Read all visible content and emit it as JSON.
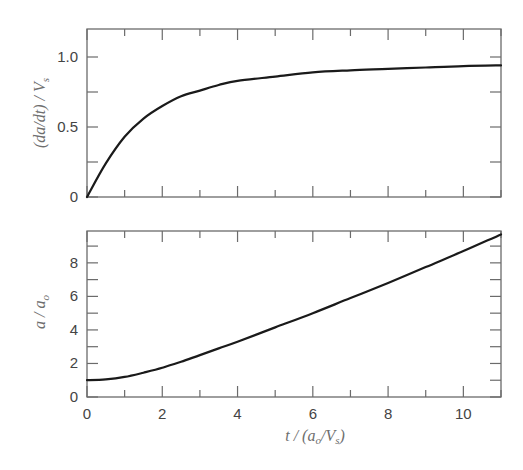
{
  "chart_data": [
    {
      "type": "line",
      "title": "",
      "xlabel": "",
      "ylabel": "(da/dt) / V_s",
      "xlim": [
        0,
        11
      ],
      "ylim": [
        0,
        1.2
      ],
      "grid": false,
      "x_ticks": [
        0,
        2,
        4,
        6,
        8,
        10
      ],
      "x_tick_labels_shown": false,
      "y_ticks": [
        0,
        0.5,
        1.0
      ],
      "y_tick_labels": [
        "0",
        "0.5",
        "1.0"
      ],
      "series": [
        {
          "name": "(da/dt)/Vs",
          "x": [
            0,
            0.5,
            1,
            1.5,
            2,
            2.5,
            3,
            3.5,
            4,
            5,
            6,
            7,
            8,
            9,
            10,
            11
          ],
          "values": [
            0,
            0.24,
            0.43,
            0.56,
            0.65,
            0.72,
            0.76,
            0.8,
            0.83,
            0.86,
            0.89,
            0.905,
            0.915,
            0.925,
            0.935,
            0.94
          ]
        }
      ]
    },
    {
      "type": "line",
      "title": "",
      "xlabel": "t / (a_o/V_s)",
      "ylabel": "a / a_o",
      "xlim": [
        0,
        11
      ],
      "ylim": [
        0,
        9.9
      ],
      "grid": false,
      "x_ticks": [
        0,
        2,
        4,
        6,
        8,
        10
      ],
      "x_tick_labels": [
        "0",
        "2",
        "4",
        "6",
        "8",
        "10"
      ],
      "y_ticks": [
        0,
        2,
        4,
        6,
        8
      ],
      "y_tick_labels": [
        "0",
        "2",
        "4",
        "6",
        "8"
      ],
      "series": [
        {
          "name": "a/ao",
          "x": [
            0,
            0.5,
            1,
            1.5,
            2,
            2.5,
            3,
            3.5,
            4,
            5,
            6,
            7,
            8,
            9,
            10,
            11
          ],
          "values": [
            1.0,
            1.05,
            1.2,
            1.45,
            1.75,
            2.1,
            2.5,
            2.9,
            3.3,
            4.15,
            5.0,
            5.9,
            6.8,
            7.75,
            8.7,
            9.7
          ]
        }
      ]
    }
  ],
  "labels": {
    "top_ylabel_main": "(da/dt) / V",
    "top_ylabel_sub": "s",
    "bottom_ylabel_main": "a / a",
    "bottom_ylabel_sub": "o",
    "xlabel_t": "t / (a",
    "xlabel_o": "o",
    "xlabel_mid": "/V",
    "xlabel_s": "s",
    "xlabel_end": ")"
  }
}
